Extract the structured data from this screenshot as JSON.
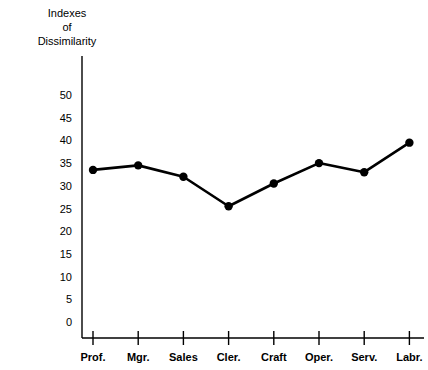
{
  "chart_data": {
    "type": "line",
    "title": "Indexes\nof\nDissimilarity",
    "xlabel": "",
    "ylabel": "",
    "categories": [
      "Prof.",
      "Mgr.",
      "Sales",
      "Cler.",
      "Craft",
      "Oper.",
      "Serv.",
      "Labr."
    ],
    "values": [
      33.5,
      34.5,
      32.0,
      25.5,
      30.5,
      35.0,
      33.0,
      39.5
    ],
    "series": [
      {
        "name": "Index of Dissimilarity",
        "values": [
          33.5,
          34.5,
          32.0,
          25.5,
          30.5,
          35.0,
          33.0,
          39.5
        ]
      }
    ],
    "ylim": [
      0,
      52
    ],
    "yticks": [
      0,
      5,
      10,
      15,
      20,
      25,
      30,
      35,
      40,
      45,
      50
    ],
    "ytick_labels": [
      "0",
      "5",
      "10",
      "15",
      "20",
      "25",
      "30",
      "35",
      "40",
      "45",
      "50"
    ],
    "grid": false,
    "legend": false,
    "legend_position": "none",
    "marker": "filled-circle",
    "line_color": "#000000",
    "marker_color": "#000000",
    "background_color": "#ffffff"
  }
}
